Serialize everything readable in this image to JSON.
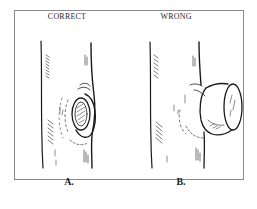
{
  "figure": {
    "panels": [
      {
        "id": "A",
        "heading": "CORRECT",
        "label": "A.",
        "description": "Branch cut flush at branch collar, leaving a clean oval wound with callus ring"
      },
      {
        "id": "B",
        "heading": "WRONG",
        "label": "B.",
        "description": "Branch cut leaving a protruding stub beyond the collar"
      }
    ]
  },
  "colors": {
    "ink": "#1a1a1a",
    "frame": "#8a8a8a",
    "background": "#ffffff"
  }
}
